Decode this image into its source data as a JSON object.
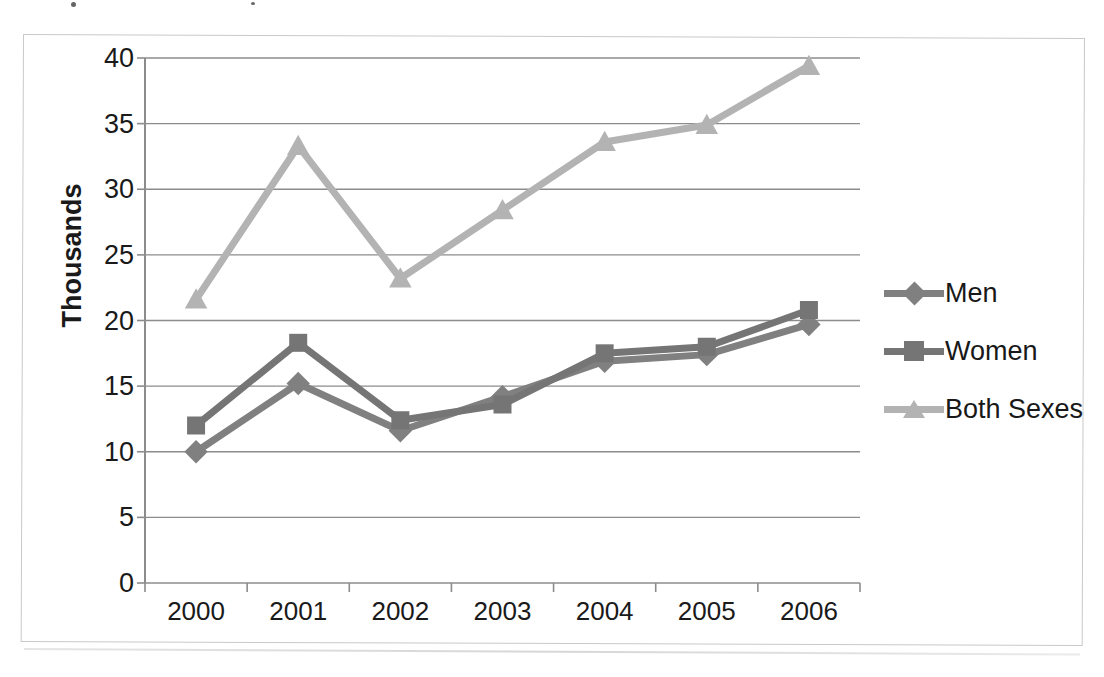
{
  "chart_data": {
    "type": "line",
    "title": "",
    "xlabel": "",
    "ylabel": "Thousands",
    "categories": [
      "2000",
      "2001",
      "2002",
      "2003",
      "2004",
      "2005",
      "2006"
    ],
    "x": [
      2000,
      2001,
      2002,
      2003,
      2004,
      2005,
      2006
    ],
    "series": [
      {
        "name": "Men",
        "marker": "diamond",
        "color": "#808080",
        "values": [
          10.0,
          15.2,
          11.6,
          14.2,
          16.9,
          17.4,
          19.7
        ]
      },
      {
        "name": "Women",
        "marker": "square",
        "color": "#757575",
        "values": [
          12.0,
          18.3,
          12.4,
          13.6,
          17.5,
          18.0,
          20.8
        ]
      },
      {
        "name": "Both Sexes",
        "marker": "triangle",
        "color": "#b3b3b3",
        "values": [
          21.6,
          33.3,
          23.2,
          28.4,
          33.6,
          34.9,
          39.4
        ]
      }
    ],
    "ylim": [
      0,
      40
    ],
    "ytick_values": [
      0,
      5,
      10,
      15,
      20,
      25,
      30,
      35,
      40
    ],
    "ytick_labels": [
      "0",
      "5",
      "10",
      "15",
      "20",
      "25",
      "30",
      "35",
      "40"
    ],
    "grid": true,
    "grid_axis": "y",
    "legend_position": "right",
    "legend_entries": [
      "Men",
      "Women",
      "Both Sexes"
    ]
  },
  "axis": {
    "y_title": "Thousands"
  },
  "colors": {
    "men": "#808080",
    "women": "#757575",
    "both_sexes": "#b3b3b3",
    "gridline": "#8c8c8c",
    "axis": "#8c8c8c",
    "frame": "#c9c9c9",
    "text": "#1a1a1a"
  }
}
